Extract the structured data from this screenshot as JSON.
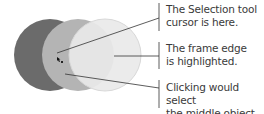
{
  "diagram": {
    "circles": [
      {
        "name": "back-object",
        "color": "#6b6b6b"
      },
      {
        "name": "middle-object",
        "color": "#b4b4b4"
      },
      {
        "name": "front-object",
        "color": "#e8e8e8"
      }
    ],
    "callouts": [
      {
        "line1": "The Selection tool",
        "line2": "cursor is here."
      },
      {
        "line1": "The frame edge",
        "line2": "is highlighted."
      },
      {
        "line1": "Clicking would select",
        "line2": "the middle object."
      }
    ]
  }
}
